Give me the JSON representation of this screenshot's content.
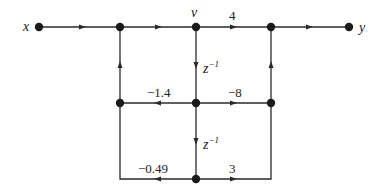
{
  "diagram": {
    "type": "signal-flow-graph",
    "nodes": [
      {
        "id": "x",
        "label": "x"
      },
      {
        "id": "n1",
        "label": ""
      },
      {
        "id": "v",
        "label": "v"
      },
      {
        "id": "n3",
        "label": ""
      },
      {
        "id": "y",
        "label": "y"
      },
      {
        "id": "m1",
        "label": ""
      },
      {
        "id": "m2",
        "label": ""
      },
      {
        "id": "m3",
        "label": ""
      },
      {
        "id": "b2",
        "label": ""
      }
    ],
    "edges": [
      {
        "from": "x",
        "to": "n1",
        "gain": ""
      },
      {
        "from": "n1",
        "to": "v",
        "gain": ""
      },
      {
        "from": "v",
        "to": "n3",
        "gain": "4"
      },
      {
        "from": "n3",
        "to": "y",
        "gain": ""
      },
      {
        "from": "v",
        "to": "m2",
        "gain": "z",
        "gain_exp": "−1"
      },
      {
        "from": "m2",
        "to": "m1",
        "gain": "−1.4"
      },
      {
        "from": "m2",
        "to": "m3",
        "gain": "−8"
      },
      {
        "from": "m1",
        "to": "n1",
        "gain": ""
      },
      {
        "from": "m3",
        "to": "n3",
        "gain": ""
      },
      {
        "from": "m2",
        "to": "b2",
        "gain": "z",
        "gain_exp": "−1"
      },
      {
        "from": "b2",
        "to": "m1",
        "gain": "−0.49"
      },
      {
        "from": "b2",
        "to": "m3",
        "gain": "3"
      }
    ]
  },
  "labels": {
    "input": "x",
    "output": "y",
    "v": "v",
    "gain_top": "4",
    "delay1_base": "z",
    "delay1_exp": "−1",
    "delay2_base": "z",
    "delay2_exp": "−1",
    "gain_mid_left": "−1.4",
    "gain_mid_right": "−8",
    "gain_bot_left": "−0.49",
    "gain_bot_right": "3"
  }
}
